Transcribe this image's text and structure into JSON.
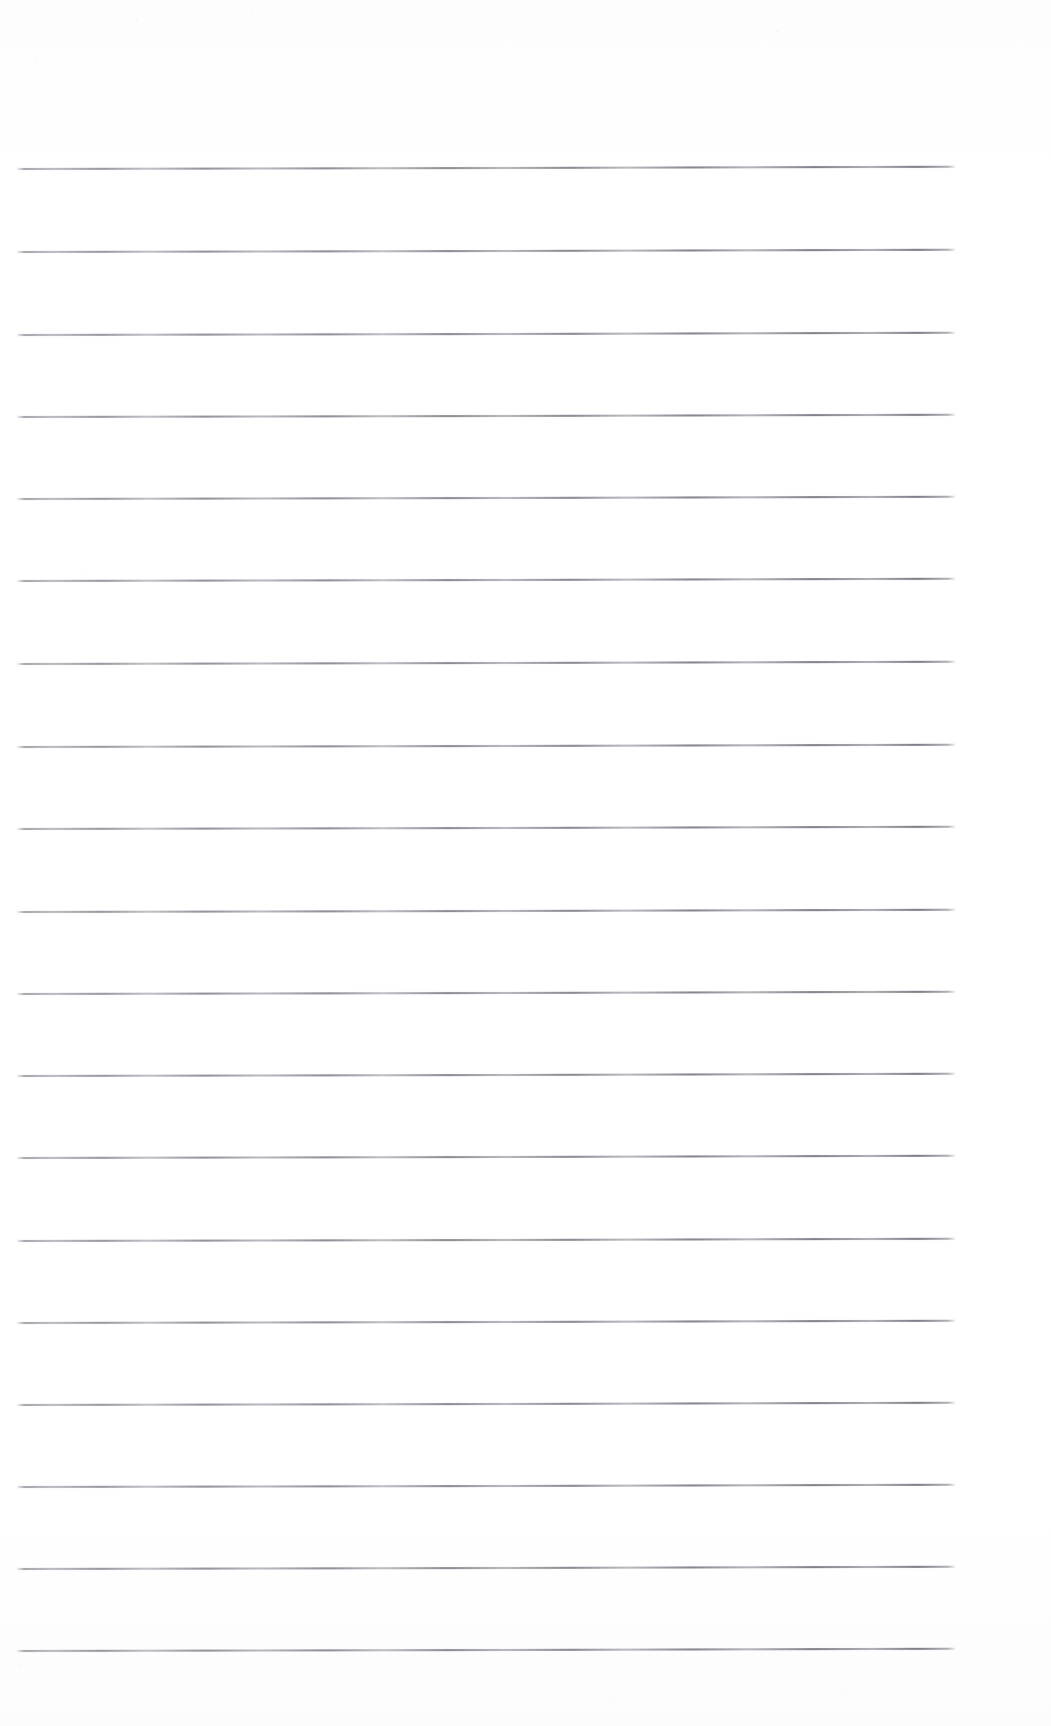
{
  "document": {
    "type": "scanned-ruled-paper",
    "title": "Blank Lined Paper Scan",
    "description": "Scanned sheet of blank ruled notebook paper with no handwriting or printed text",
    "page_width": 1051,
    "page_height": 1726,
    "background_color": "#fefefe",
    "has_text": false,
    "has_margin_rule": false,
    "has_header": false,
    "has_page_number": false
  },
  "ruling": {
    "line_count": 19,
    "line_color": "#6e707a",
    "line_thickness_px": 2,
    "line_spacing_px": 82,
    "line_start_x": 17,
    "line_end_x": 955,
    "line_length_px": 938,
    "first_line_y": 168,
    "last_line_y": 1650,
    "skew_degrees": -0.13,
    "lines_y": [
      168,
      251,
      334,
      416,
      498,
      580,
      663,
      746,
      828,
      911,
      993,
      1075,
      1157,
      1240,
      1322,
      1404,
      1486,
      1568,
      1650
    ]
  },
  "margins": {
    "top_blank_px": 168,
    "bottom_blank_px": 76,
    "left_blank_px": 17,
    "right_blank_px": 96
  },
  "artifacts": {
    "speckle_top": true,
    "speckle_bottom": true,
    "description": "faint grayish scanner speckles along the top and bottom edges"
  }
}
